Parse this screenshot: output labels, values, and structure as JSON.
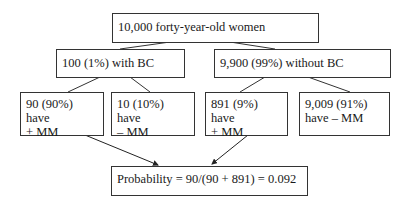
{
  "diagram": {
    "root": {
      "text": "10,000 forty-year-old women"
    },
    "level2": [
      {
        "text": "100 (1%) with BC"
      },
      {
        "text": "9,900 (99%) without BC"
      }
    ],
    "level3": [
      {
        "line1": "90 (90%) have",
        "line2": "+ MM"
      },
      {
        "line1": "10 (10%) have",
        "line2": "– MM"
      },
      {
        "line1": "891 (9%) have",
        "line2": "+ MM"
      },
      {
        "line1": "9,009 (91%)",
        "line2": "have – MM"
      }
    ],
    "result": {
      "text": "Probability = 90/(90 + 891) = 0.092"
    }
  },
  "colors": {
    "line": "#333333",
    "background": "#ffffff"
  }
}
